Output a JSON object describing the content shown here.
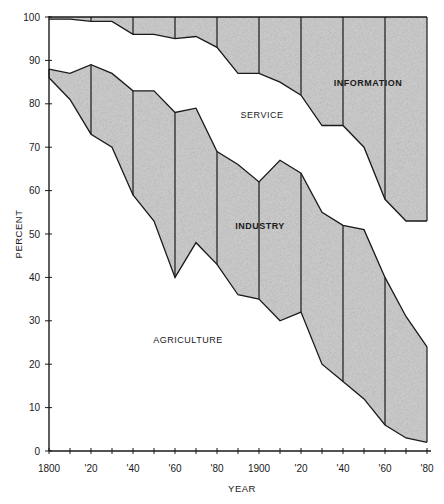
{
  "chart_data": {
    "type": "area",
    "title": "",
    "xlabel": "YEAR",
    "ylabel": "PERCENT",
    "xlim": [
      1800,
      1980
    ],
    "ylim": [
      0,
      100
    ],
    "grid": false,
    "stacked": true,
    "x": [
      1800,
      1810,
      1820,
      1830,
      1840,
      1850,
      1860,
      1870,
      1880,
      1890,
      1900,
      1910,
      1920,
      1930,
      1940,
      1950,
      1960,
      1970,
      1980
    ],
    "x_tick_labels": [
      "1800",
      "'20",
      "'40",
      "'60",
      "'80",
      "1900",
      "'20",
      "'40",
      "'60",
      "'80"
    ],
    "x_tick_values": [
      1800,
      1820,
      1840,
      1860,
      1880,
      1900,
      1920,
      1940,
      1960,
      1980
    ],
    "y_tick_labels": [
      "0",
      "10",
      "20",
      "30",
      "40",
      "50",
      "60",
      "70",
      "80",
      "90",
      "100"
    ],
    "y_tick_values": [
      0,
      10,
      20,
      30,
      40,
      50,
      60,
      70,
      80,
      90,
      100
    ],
    "series": [
      {
        "name": "AGRICULTURE",
        "shaded": false,
        "values": [
          86,
          81,
          73,
          70,
          59,
          53,
          40,
          48,
          43,
          36,
          35,
          30,
          32,
          20,
          16,
          12,
          6,
          3,
          2
        ]
      },
      {
        "name": "INDUSTRY",
        "shaded": true,
        "values": [
          2,
          6,
          16,
          17,
          24,
          30,
          38,
          31,
          26,
          30,
          27,
          37,
          32,
          35,
          36,
          39,
          34,
          28,
          22
        ]
      },
      {
        "name": "SERVICE",
        "shaded": false,
        "values": [
          11.5,
          12.5,
          10,
          12,
          13,
          13,
          17,
          16.5,
          24,
          21,
          25,
          18,
          18,
          20,
          23,
          19,
          18,
          22,
          29
        ]
      },
      {
        "name": "INFORMATION",
        "shaded": true,
        "values": [
          0.5,
          0.5,
          1,
          1,
          4,
          4,
          5,
          4.5,
          7,
          13,
          13,
          15,
          18,
          25,
          25,
          30,
          42,
          47,
          47
        ]
      }
    ],
    "cumulative_boundaries": {
      "agriculture_top": [
        86,
        81,
        73,
        70,
        59,
        53,
        40,
        48,
        43,
        36,
        35,
        30,
        32,
        20,
        16,
        12,
        6,
        3,
        2
      ],
      "industry_top": [
        88,
        87,
        89,
        87,
        83,
        83,
        78,
        79,
        69,
        66,
        62,
        67,
        64,
        55,
        52,
        51,
        40,
        31,
        24
      ],
      "service_top": [
        99.5,
        99.5,
        99,
        99,
        96,
        96,
        95,
        95.5,
        93,
        87,
        87,
        85,
        82,
        75,
        75,
        70,
        58,
        53,
        53
      ]
    },
    "annotations": [
      {
        "text": "AGRICULTURE",
        "year": 1838,
        "pct": 25
      },
      {
        "text": "INDUSTRY",
        "year": 1902,
        "pct": 52
      },
      {
        "text": "SERVICE",
        "year": 1880,
        "pct": 79
      },
      {
        "text": "INFORMATION",
        "year": 1930,
        "pct": 84
      }
    ],
    "legend": "none (labels placed inside regions)",
    "colors": {
      "shade": "#c9c9c9",
      "line": "#1a1a1a",
      "background": "#ffffff"
    }
  }
}
